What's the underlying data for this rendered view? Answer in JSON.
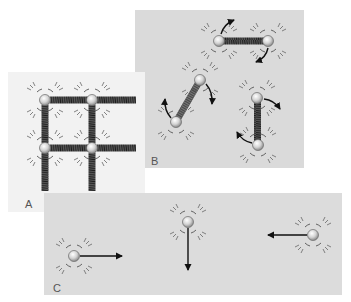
{
  "figure": {
    "panels": [
      {
        "id": "A",
        "label": "A",
        "motion": "vibration",
        "background": "#f2f2f2"
      },
      {
        "id": "B",
        "label": "B",
        "motion": "rotation",
        "background": "#dadada"
      },
      {
        "id": "C",
        "label": "C",
        "motion": "translation",
        "background": "#dcdcdc"
      }
    ]
  },
  "colors": {
    "atom_fill": "#d8d8d8",
    "atom_stroke": "#6a6a6a",
    "spring": "#3a3a3a",
    "arrow": "#111111",
    "wave": "#555555"
  }
}
